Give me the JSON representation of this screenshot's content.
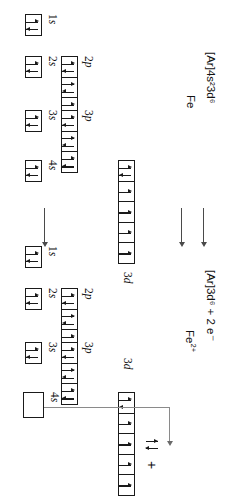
{
  "diagram": {
    "type": "orbital-box-diagram",
    "ink_color": "#1a1a1a",
    "arrow_color": "#4a4a4a",
    "connector_color": "#8a8a8a"
  },
  "species": [
    {
      "id": "fe",
      "name": "Fe",
      "configuration": "[Ar]4s23d6",
      "configuration_display": "[Ar]4s²23d⁶",
      "orbitals": [
        {
          "label": "1s",
          "label_n": "1",
          "label_l": "s",
          "boxes": 1,
          "occupancy": [
            "pair"
          ]
        },
        {
          "label": "2s",
          "label_n": "2",
          "label_l": "s",
          "boxes": 1,
          "occupancy": [
            "pair"
          ]
        },
        {
          "label": "2p",
          "label_n": "2",
          "label_l": "p",
          "boxes": 3,
          "occupancy": [
            "pair",
            "pair",
            "pair"
          ]
        },
        {
          "label": "3s",
          "label_n": "3",
          "label_l": "s",
          "boxes": 1,
          "occupancy": [
            "pair"
          ]
        },
        {
          "label": "3p",
          "label_n": "3",
          "label_l": "p",
          "boxes": 3,
          "occupancy": [
            "pair",
            "pair",
            "pair"
          ]
        },
        {
          "label": "4s",
          "label_n": "4",
          "label_l": "s",
          "boxes": 1,
          "occupancy": [
            "pair"
          ]
        },
        {
          "label": "3d",
          "label_n": "3",
          "label_l": "d",
          "boxes": 5,
          "occupancy": [
            "pair",
            "single",
            "single",
            "single",
            "single"
          ]
        }
      ]
    },
    {
      "id": "fe2plus",
      "name": "Fe2+",
      "name_base": "Fe",
      "name_charge": "2+",
      "configuration": "[Ar]3d6 + 2 e-",
      "configuration_display": "[Ar]3d⁶  +  2 e⁻",
      "orbitals": [
        {
          "label": "1s",
          "label_n": "1",
          "label_l": "s",
          "boxes": 1,
          "occupancy": [
            "pair"
          ]
        },
        {
          "label": "2s",
          "label_n": "2",
          "label_l": "s",
          "boxes": 1,
          "occupancy": [
            "pair"
          ]
        },
        {
          "label": "2p",
          "label_n": "2",
          "label_l": "p",
          "boxes": 3,
          "occupancy": [
            "pair",
            "pair",
            "pair"
          ]
        },
        {
          "label": "3s",
          "label_n": "3",
          "label_l": "s",
          "boxes": 1,
          "occupancy": [
            "pair"
          ]
        },
        {
          "label": "3p",
          "label_n": "3",
          "label_l": "p",
          "boxes": 3,
          "occupancy": [
            "pair",
            "pair",
            "pair"
          ]
        },
        {
          "label": "4s",
          "label_n": "4",
          "label_l": "s",
          "boxes": 1,
          "occupancy": [
            "empty"
          ]
        },
        {
          "label": "3d",
          "label_n": "3",
          "label_l": "d",
          "boxes": 5,
          "occupancy": [
            "pair",
            "single",
            "single",
            "single",
            "single"
          ]
        }
      ]
    }
  ],
  "ejected": {
    "plus_sign": "+",
    "note": "lone electron pair removed from the 4s orbital"
  },
  "labels": {
    "fe_name": "Fe",
    "fe_config": "[Ar]4s²3d⁶",
    "ion_name_base": "Fe",
    "ion_name_charge": "2+",
    "ion_config": "[Ar]3d⁶  +  2 e⁻",
    "orb_1s_n": "1",
    "orb_1s_l": "s",
    "orb_2s_n": "2",
    "orb_2s_l": "s",
    "orb_2p_n": "2",
    "orb_2p_l": "p",
    "orb_3s_n": "3",
    "orb_3s_l": "s",
    "orb_3p_n": "3",
    "orb_3p_l": "p",
    "orb_4s_n": "4",
    "orb_4s_l": "s",
    "orb_3d_n": "3",
    "orb_3d_l": "d"
  }
}
